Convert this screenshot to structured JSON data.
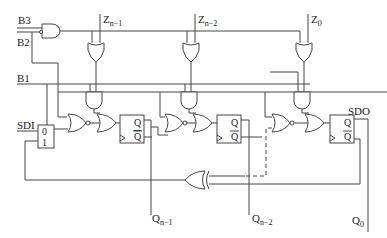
{
  "diagram": {
    "type": "logic-circuit",
    "inputs": {
      "b3": "B3",
      "b2": "B2",
      "b1": "B1",
      "sdi": "SDI"
    },
    "outputs": {
      "sdo": "SDO"
    },
    "z_inputs": [
      {
        "main": "Z",
        "sub": "n−1"
      },
      {
        "main": "Z",
        "sub": "n−2"
      },
      {
        "main": "Z",
        "sub": "0"
      }
    ],
    "q_outputs": [
      {
        "main": "Q",
        "sub": "n−1"
      },
      {
        "main": "Q",
        "sub": "n−2"
      },
      {
        "main": "Q",
        "sub": "0"
      }
    ],
    "mux": {
      "in0": "0",
      "in1": "1"
    },
    "flipflop": {
      "q": "Q",
      "qbar": "Q"
    },
    "colors": {
      "line": "#444444",
      "background": "#ffffff"
    }
  }
}
